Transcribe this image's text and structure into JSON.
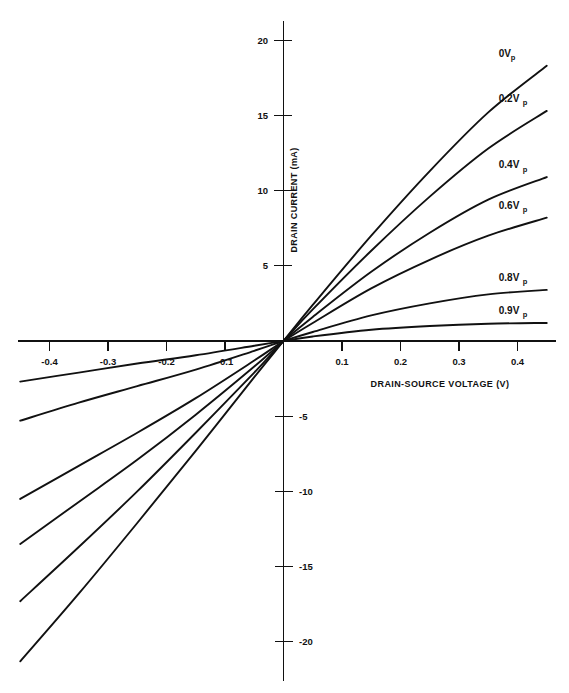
{
  "chart_data": {
    "type": "line",
    "title": "",
    "subtitle": "",
    "xlabel": "DRAIN-SOURCE VOLTAGE (V)",
    "ylabel": "DRAIN CURRENT (mA)",
    "xlim": [
      -0.45,
      0.465
    ],
    "ylim": [
      -22.5,
      21.5
    ],
    "grid": false,
    "legend_position": "inline-right-of-curves",
    "x_ticks": [
      -0.4,
      -0.3,
      -0.2,
      -0.1,
      0.1,
      0.2,
      0.3,
      0.4
    ],
    "x_tick_labels": [
      "-0.4",
      "-0.3",
      "-0.2",
      "-0.1",
      "0.1",
      "0.2",
      "0.3",
      "0.4"
    ],
    "y_ticks": [
      20,
      15,
      10,
      5,
      -5,
      -10,
      -15,
      -20
    ],
    "y_tick_labels": [
      "20",
      "15",
      "10",
      "5",
      "-5",
      "-10",
      "-15",
      "-20"
    ],
    "x_tick_label_side": "below-axis",
    "y_tick_label_side": "left-for-positive-right-for-negative",
    "origin_value": [
      0,
      0
    ],
    "series": [
      {
        "name": "0Vp",
        "label_main": "0V",
        "label_sub": "p",
        "x": [
          -0.45,
          -0.35,
          -0.25,
          -0.15,
          -0.05,
          0,
          0.05,
          0.15,
          0.25,
          0.35,
          0.45
        ],
        "values": [
          -21.3,
          -16.8,
          -12.1,
          -7.3,
          -2.4,
          0,
          2.4,
          7.0,
          11.3,
          15.2,
          18.3
        ]
      },
      {
        "name": "0.2Vp",
        "label_main": "0.2V",
        "label_sub": "p",
        "x": [
          -0.45,
          -0.35,
          -0.25,
          -0.15,
          -0.05,
          0,
          0.05,
          0.15,
          0.25,
          0.35,
          0.45
        ],
        "values": [
          -17.3,
          -13.7,
          -10.0,
          -6.1,
          -2.1,
          0,
          2.1,
          6.0,
          9.6,
          12.8,
          15.3
        ]
      },
      {
        "name": "0.4Vp",
        "label_main": "0.4V",
        "label_sub": "p",
        "x": [
          -0.45,
          -0.35,
          -0.25,
          -0.15,
          -0.05,
          0,
          0.05,
          0.15,
          0.25,
          0.35,
          0.45
        ],
        "values": [
          -13.5,
          -10.7,
          -7.9,
          -4.9,
          -1.7,
          0,
          1.6,
          4.6,
          7.2,
          9.4,
          10.9
        ]
      },
      {
        "name": "0.6Vp",
        "label_main": "0.6V",
        "label_sub": "p",
        "x": [
          -0.45,
          -0.35,
          -0.25,
          -0.15,
          -0.05,
          0,
          0.05,
          0.15,
          0.25,
          0.35,
          0.45
        ],
        "values": [
          -10.5,
          -8.3,
          -6.1,
          -3.8,
          -1.3,
          0,
          1.2,
          3.5,
          5.4,
          7.0,
          8.2
        ]
      },
      {
        "name": "0.8Vp",
        "label_main": "0.8V",
        "label_sub": "p",
        "x": [
          -0.45,
          -0.35,
          -0.25,
          -0.15,
          -0.05,
          0,
          0.05,
          0.15,
          0.25,
          0.35,
          0.45
        ],
        "values": [
          -5.3,
          -4.1,
          -3.0,
          -1.9,
          -0.65,
          0,
          0.6,
          1.7,
          2.5,
          3.1,
          3.4
        ]
      },
      {
        "name": "0.9Vp",
        "label_main": "0.9V",
        "label_sub": "p",
        "x": [
          -0.45,
          -0.35,
          -0.25,
          -0.15,
          -0.05,
          0,
          0.05,
          0.15,
          0.25,
          0.35,
          0.45
        ],
        "values": [
          -2.7,
          -2.1,
          -1.5,
          -0.95,
          -0.32,
          0,
          0.3,
          0.75,
          1.0,
          1.15,
          1.2
        ]
      }
    ],
    "colors": {
      "curve": "#111111",
      "axis": "#111111",
      "text": "#111111",
      "background": "#ffffff"
    }
  }
}
